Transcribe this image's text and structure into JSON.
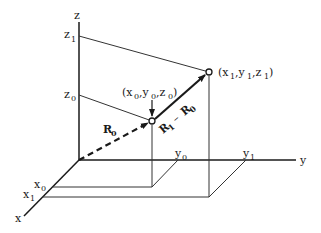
{
  "diagram": {
    "title": "",
    "axes": {
      "x": {
        "label": "x",
        "ticks": [
          "x0",
          "x1"
        ]
      },
      "y": {
        "label": "y",
        "ticks": [
          "y0",
          "y1"
        ]
      },
      "z": {
        "label": "z",
        "ticks": [
          "z0",
          "z1"
        ]
      }
    },
    "points": [
      {
        "id": "P0",
        "label": "(x0 ,y0 ,z0 )",
        "coords": [
          "x0",
          "y0",
          "z0"
        ]
      },
      {
        "id": "P1",
        "label": "(x1 ,y1 ,z1 )",
        "coords": [
          "x1",
          "y1",
          "z1"
        ]
      }
    ],
    "vectors": [
      {
        "id": "R0",
        "label": "R0",
        "from": "origin",
        "to": "P0",
        "style": "dashed"
      },
      {
        "id": "R1-R0",
        "label": "R1 − R0",
        "from": "P0",
        "to": "P1",
        "style": "solid"
      }
    ],
    "text": {
      "z": "z",
      "z_sub1": "1",
      "z_sub0": "0",
      "y": "y",
      "x": "x",
      "p0_open": "(x",
      "p0_s0": "0",
      "p0_comma1": ",y",
      "p0_s1": "0",
      "p0_comma2": ",z",
      "p0_s2": "0",
      "p0_close": ")",
      "p1_open": "(x",
      "p1_s0": "1",
      "p1_comma1": ",y",
      "p1_s1": "1",
      "p1_comma2": ",z",
      "p1_s2": "1",
      "p1_close": ")",
      "R": "R",
      "R0_sub": "0",
      "R1_sub": "1",
      "minus": "–"
    },
    "colors": {
      "line": "#1a1a1a",
      "guide": "#333333",
      "background": "#ffffff"
    }
  }
}
